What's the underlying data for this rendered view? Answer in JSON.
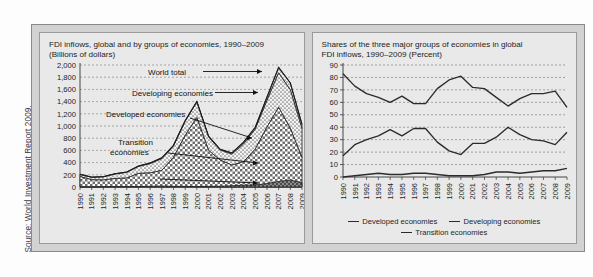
{
  "source": {
    "text": "Source: World Investment Report 2009."
  },
  "left_panel": {
    "title": "FDI inflows, global and by groups of economies, 1990–2009\n(Billions of dollars)",
    "annotations": [
      {
        "label": "World total"
      },
      {
        "label": "Developing economies"
      },
      {
        "label": "Developed economies"
      },
      {
        "label": "Transition\neconomies"
      }
    ]
  },
  "right_panel": {
    "title": "Shares of the three major groups of economies in global\nFDI inflows, 1990–2009 (Percent)",
    "legend": [
      {
        "label": "Developed economies",
        "color": "#2b2b2b"
      },
      {
        "label": "Developing economies",
        "color": "#2b2b2b"
      },
      {
        "label": "Transition economies",
        "color": "#2b2b2b"
      }
    ]
  },
  "chart_data": [
    {
      "id": "fdi-inflows",
      "type": "area",
      "stacked": true,
      "title": "FDI inflows, global and by groups of economies, 1990–2009 (Billions of dollars)",
      "xlabel": "",
      "ylabel": "Billions of dollars",
      "ylim": [
        0,
        2000
      ],
      "yticks": [
        0,
        200,
        400,
        600,
        800,
        1000,
        1200,
        1400,
        1600,
        1800,
        2000
      ],
      "ytick_labels": [
        "0",
        "200",
        "400",
        "600",
        "800",
        "1,000",
        "1,200",
        "1,400",
        "1,600",
        "1,800",
        "2,000"
      ],
      "grid": true,
      "categories": [
        "1990",
        "1991",
        "1992",
        "1993",
        "1994",
        "1995",
        "1996",
        "1997",
        "1998",
        "1999",
        "2000",
        "2001",
        "2002",
        "2003",
        "2004",
        "2005",
        "2006",
        "2007",
        "2008",
        "2009"
      ],
      "series": [
        {
          "name": "Developed economies",
          "pattern": "checkerboard",
          "values": [
            172,
            118,
            114,
            139,
            146,
            222,
            230,
            272,
            483,
            845,
            1138,
            601,
            441,
            359,
            414,
            619,
            981,
            1306,
            962,
            478
          ]
        },
        {
          "name": "Developing economies",
          "pattern": "dots",
          "values": [
            35,
            41,
            51,
            73,
            93,
            113,
            152,
            191,
            189,
            232,
            256,
            221,
            164,
            179,
            290,
            329,
            434,
            565,
            630,
            478
          ]
        },
        {
          "name": "Transition economies",
          "pattern": "solid-dark",
          "values": [
            0,
            2,
            4,
            6,
            6,
            8,
            11,
            15,
            11,
            10,
            7,
            11,
            12,
            20,
            31,
            31,
            57,
            91,
            114,
            70
          ]
        }
      ],
      "total_series": {
        "name": "World total",
        "values": [
          207,
          161,
          169,
          218,
          245,
          343,
          393,
          478,
          683,
          1087,
          1401,
          833,
          617,
          558,
          735,
          979,
          1472,
          1962,
          1706,
          1026
        ]
      }
    },
    {
      "id": "fdi-shares",
      "type": "line",
      "title": "Shares of the three major groups of economies in global FDI inflows, 1990–2009 (Percent)",
      "xlabel": "",
      "ylabel": "Percent",
      "ylim": [
        0,
        90
      ],
      "yticks": [
        0,
        10,
        20,
        30,
        40,
        50,
        60,
        70,
        80,
        90
      ],
      "ytick_labels": [
        "0",
        "10",
        "20",
        "30",
        "40",
        "50",
        "60",
        "70",
        "80",
        "90"
      ],
      "grid": true,
      "legend_position": "bottom",
      "categories": [
        "1990",
        "1991",
        "1992",
        "1993",
        "1994",
        "1995",
        "1996",
        "1997",
        "1998",
        "1999",
        "2000",
        "2001",
        "2002",
        "2003",
        "2004",
        "2005",
        "2006",
        "2007",
        "2008",
        "2009"
      ],
      "series": [
        {
          "name": "Developed economies",
          "values": [
            83,
            73,
            67,
            64,
            60,
            65,
            59,
            59,
            71,
            78,
            81,
            72,
            71,
            64,
            57,
            63,
            67,
            67,
            69,
            56
          ]
        },
        {
          "name": "Developing economies",
          "values": [
            17,
            26,
            30,
            33,
            38,
            33,
            39,
            39,
            28,
            21,
            18,
            27,
            27,
            32,
            40,
            34,
            30,
            29,
            26,
            36
          ]
        },
        {
          "name": "Transition economies",
          "values": [
            0,
            1,
            2,
            3,
            2,
            2,
            3,
            3,
            2,
            1,
            1,
            1,
            2,
            4,
            4,
            3,
            4,
            5,
            5,
            7
          ]
        }
      ]
    }
  ]
}
